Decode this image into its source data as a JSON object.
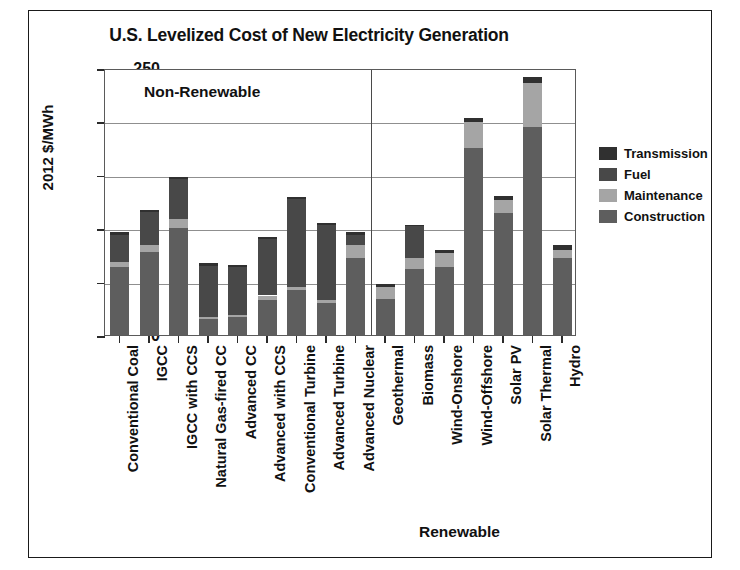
{
  "chart_data": {
    "type": "bar",
    "title": "U.S. Levelized Cost of New Electricity Generation",
    "xlabel": "",
    "ylabel": "2012 $/MWh",
    "ylim": [
      0,
      250
    ],
    "yticks": [
      0,
      50,
      100,
      150,
      200,
      250
    ],
    "grid": true,
    "stacked": true,
    "legend_position": "right",
    "annotations": [
      {
        "text": "Non-Renewable",
        "group": "non-renewable"
      },
      {
        "text": "Renewable",
        "group": "renewable"
      }
    ],
    "categories": [
      "Conventional Coal",
      "IGCC",
      "IGCC with CCS",
      "Natural Gas-fired CC",
      "Advanced CC",
      "Advanced with CCS",
      "Conventional Turbine",
      "Advanced Turbine",
      "Advanced Nuclear",
      "Geothermal",
      "Biomass",
      "Wind-Onshore",
      "Wind-Offshore",
      "Solar PV",
      "Solar Thermal",
      "Hydro"
    ],
    "group_split_after_index": 8,
    "series": [
      {
        "name": "Construction",
        "color": "#5e5e5e",
        "values": [
          64,
          78,
          100,
          15,
          17,
          33,
          42,
          30,
          72,
          34,
          62,
          64,
          175,
          114,
          195,
          72
        ]
      },
      {
        "name": "Maintenance",
        "color": "#a5a5a5",
        "values": [
          4,
          6,
          9,
          2,
          2,
          4,
          3,
          3,
          12,
          11,
          10,
          13,
          24,
          12,
          41,
          8
        ]
      },
      {
        "name": "Fuel",
        "color": "#484848",
        "values": [
          26,
          31,
          37,
          48,
          45,
          53,
          82,
          70,
          10,
          0,
          30,
          0,
          0,
          0,
          0,
          0
        ]
      },
      {
        "name": "Transmission",
        "color": "#303030",
        "values": [
          2,
          2,
          2,
          2,
          2,
          2,
          2,
          2,
          2,
          3,
          1,
          3,
          4,
          4,
          6,
          4
        ]
      }
    ],
    "totals": [
      96,
      117,
      148,
      67,
      66,
      92,
      129,
      105,
      96,
      48,
      103,
      80,
      203,
      130,
      242,
      84
    ]
  },
  "legend": {
    "items": [
      {
        "label": "Transmission",
        "color": "#303030"
      },
      {
        "label": "Fuel",
        "color": "#484848"
      },
      {
        "label": "Maintenance",
        "color": "#a5a5a5"
      },
      {
        "label": "Construction",
        "color": "#5e5e5e"
      }
    ]
  }
}
